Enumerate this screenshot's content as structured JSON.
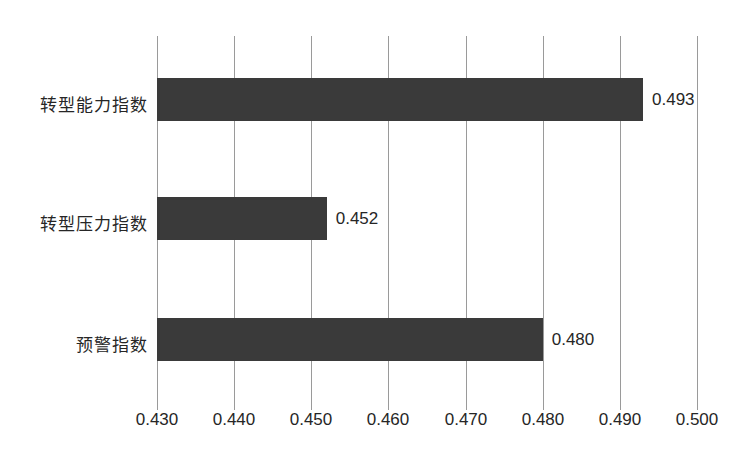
{
  "chart_data": {
    "type": "bar",
    "orientation": "horizontal",
    "title": "",
    "subtitle": "",
    "xlabel": "",
    "ylabel": "",
    "categories": [
      "转型能力指数",
      "转型压力指数",
      "预警指数"
    ],
    "values": [
      0.493,
      0.452,
      0.48
    ],
    "value_labels": [
      "0.493",
      "0.452",
      "0.480"
    ],
    "xlim": [
      0.43,
      0.5
    ],
    "xticks": [
      0.43,
      0.44,
      0.45,
      0.46,
      0.47,
      0.48,
      0.49,
      0.5
    ],
    "xtick_labels": [
      "0.430",
      "0.440",
      "0.450",
      "0.460",
      "0.470",
      "0.480",
      "0.490",
      "0.500"
    ],
    "grid": true,
    "grid_axis": "x",
    "legend": false,
    "legend_position": "none",
    "series": [
      {
        "name": "",
        "values": [
          0.493,
          0.452,
          0.48
        ]
      }
    ]
  },
  "colors": {
    "bar": "#3a3a3a",
    "gridline": "#9a9a9a",
    "text": "#262626",
    "background": "#ffffff"
  },
  "bars": [
    {
      "category": "转型能力指数",
      "value": 0.493,
      "label": "0.493"
    },
    {
      "category": "转型压力指数",
      "value": 0.452,
      "label": "0.452"
    },
    {
      "category": "预警指数",
      "value": 0.48,
      "label": "0.480"
    }
  ],
  "xticks": [
    {
      "value": 0.43,
      "label": "0.430"
    },
    {
      "value": 0.44,
      "label": "0.440"
    },
    {
      "value": 0.45,
      "label": "0.450"
    },
    {
      "value": 0.46,
      "label": "0.460"
    },
    {
      "value": 0.47,
      "label": "0.470"
    },
    {
      "value": 0.48,
      "label": "0.480"
    },
    {
      "value": 0.49,
      "label": "0.490"
    },
    {
      "value": 0.5,
      "label": "0.500"
    }
  ]
}
